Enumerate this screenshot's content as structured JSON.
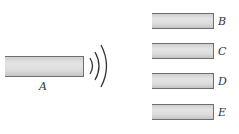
{
  "diagram": {
    "source_bar": {
      "label": "A"
    },
    "target_bars": [
      {
        "label": "B"
      },
      {
        "label": "C"
      },
      {
        "label": "D"
      },
      {
        "label": "E"
      }
    ],
    "wave_icon": "sound-waves-icon",
    "colors": {
      "bar_fill": "#dcdcdc",
      "bar_edge": "#6f6f6f",
      "wave": "#333333"
    }
  }
}
